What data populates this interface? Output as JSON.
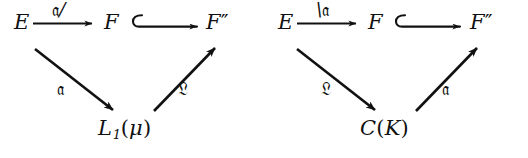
{
  "figure": {
    "type": "commutative-diagram-pair",
    "background_color": "#ffffff",
    "ink_color": "#111111"
  },
  "diagrams": [
    {
      "id": "left",
      "nodes": {
        "top_left": "E",
        "top_mid": "F",
        "top_right_base": "F",
        "top_right_primes": "″",
        "bottom_base": "L",
        "bottom_sub": "1",
        "bottom_arg_open": "(",
        "bottom_arg": "μ",
        "bottom_arg_close": ")"
      },
      "edges": {
        "top": {
          "from": "E",
          "to": "F",
          "label_frak": "𝔞",
          "label_suffix": "/",
          "arrow": "straight-arrow"
        },
        "inclusion": {
          "from": "F",
          "to": "F″",
          "label": "",
          "arrow": "hooked-arrow"
        },
        "down_left": {
          "from": "E",
          "to": "L₁(μ)",
          "label_frak": "𝔞",
          "arrow": "diagonal-arrow-down-right"
        },
        "up_right": {
          "from": "L₁(μ)",
          "to": "F″",
          "label_frak": "𝔏",
          "arrow": "diagonal-arrow-up-right"
        }
      }
    },
    {
      "id": "right",
      "nodes": {
        "top_left": "E",
        "top_mid": "F",
        "top_right_base": "F",
        "top_right_primes": "″",
        "bottom_base": "C",
        "bottom_sub": "",
        "bottom_arg_open": "(",
        "bottom_arg": "K",
        "bottom_arg_close": ")"
      },
      "edges": {
        "top": {
          "from": "E",
          "to": "F",
          "label_frak": "𝔞",
          "label_prefix": "\\",
          "arrow": "straight-arrow"
        },
        "inclusion": {
          "from": "F",
          "to": "F″",
          "label": "",
          "arrow": "hooked-arrow"
        },
        "down_left": {
          "from": "E",
          "to": "C(K)",
          "label_frak": "𝔏",
          "arrow": "diagonal-arrow-down-right"
        },
        "up_right": {
          "from": "C(K)",
          "to": "F″",
          "label_frak": "𝔞",
          "arrow": "diagonal-arrow-up-right"
        }
      }
    }
  ]
}
